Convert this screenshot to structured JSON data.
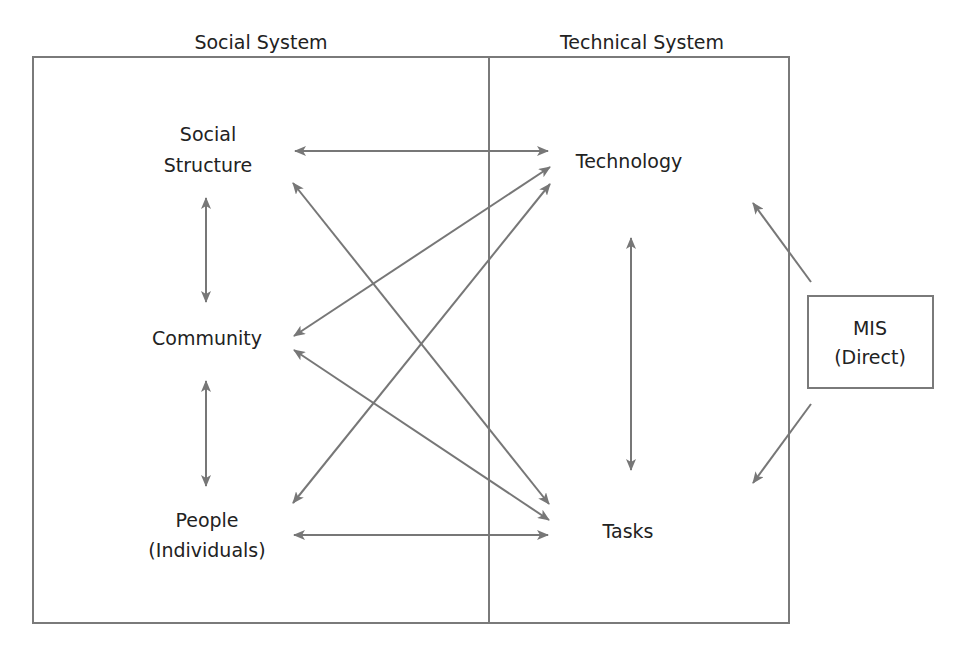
{
  "colors": {
    "background": "#ffffff",
    "frame": "#7a7a7a",
    "arrow": "#777777",
    "text": "#222222"
  },
  "caption": {
    "text": "Figure: Components of the system (caption clipped at top of image)",
    "visible": "clipped"
  },
  "headers": {
    "social_system": "Social System",
    "technical_system": "Technical System"
  },
  "nodes": {
    "social_structure": {
      "line1": "Social",
      "line2": "Structure"
    },
    "community": {
      "label": "Community"
    },
    "people": {
      "line1": "People",
      "line2": "(Individuals)"
    },
    "technology": {
      "label": "Technology"
    },
    "tasks": {
      "label": "Tasks"
    },
    "mis": {
      "line1": "MIS",
      "line2": "(Direct)"
    }
  },
  "edges": [
    {
      "from": "Social Structure",
      "to": "Technology",
      "type": "bidirectional"
    },
    {
      "from": "Social Structure",
      "to": "Community",
      "type": "bidirectional"
    },
    {
      "from": "Social Structure",
      "to": "Tasks",
      "type": "bidirectional"
    },
    {
      "from": "Community",
      "to": "Technology",
      "type": "bidirectional"
    },
    {
      "from": "Community",
      "to": "Tasks",
      "type": "bidirectional"
    },
    {
      "from": "Community",
      "to": "People",
      "type": "bidirectional"
    },
    {
      "from": "People",
      "to": "Technology",
      "type": "bidirectional"
    },
    {
      "from": "People",
      "to": "Tasks",
      "type": "bidirectional"
    },
    {
      "from": "Technology",
      "to": "Tasks",
      "type": "bidirectional"
    },
    {
      "from": "MIS",
      "to": "Technology",
      "type": "directed"
    },
    {
      "from": "MIS",
      "to": "Tasks",
      "type": "directed"
    }
  ]
}
